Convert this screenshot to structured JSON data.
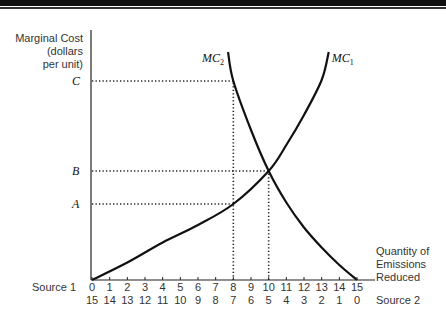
{
  "chart_data": {
    "type": "line",
    "title": "",
    "ylabel_lines": [
      "Marginal Cost",
      "(dollars",
      "per unit)"
    ],
    "xlabel_lines": [
      "Quantity of",
      "Emissions",
      "Reduced"
    ],
    "xlim": [
      0,
      15
    ],
    "ylim": [
      0,
      1
    ],
    "grid": false,
    "x_axis_rows": [
      {
        "label": "Source 1",
        "ticks": [
          "0",
          "1",
          "2",
          "3",
          "4",
          "5",
          "6",
          "7",
          "8",
          "9",
          "10",
          "11",
          "12",
          "13",
          "14",
          "15"
        ]
      },
      {
        "label": "Source 2",
        "ticks": [
          "15",
          "14",
          "13",
          "12",
          "11",
          "10",
          "9",
          "8",
          "7",
          "6",
          "5",
          "4",
          "3",
          "2",
          "1",
          "0"
        ]
      }
    ],
    "y_levels": [
      {
        "label": "C",
        "value": 0.796
      },
      {
        "label": "B",
        "value": 0.436
      },
      {
        "label": "A",
        "value": 0.304
      }
    ],
    "series": [
      {
        "name": "MC",
        "subscript": "1",
        "description": "Source 1 marginal cost, rising with Source 1 reduction",
        "points": [
          [
            0,
            0
          ],
          [
            2,
            0.07
          ],
          [
            4,
            0.15
          ],
          [
            6,
            0.22
          ],
          [
            8,
            0.304
          ],
          [
            10,
            0.436
          ],
          [
            11,
            0.54
          ],
          [
            12,
            0.66
          ],
          [
            13,
            0.8
          ],
          [
            13.4,
            0.912
          ]
        ]
      },
      {
        "name": "MC",
        "subscript": "2",
        "description": "Source 2 marginal cost, rising as Source 1 quantity falls",
        "points": [
          [
            7.7,
            0.912
          ],
          [
            8,
            0.796
          ],
          [
            9,
            0.6
          ],
          [
            10,
            0.436
          ],
          [
            11,
            0.31
          ],
          [
            12,
            0.21
          ],
          [
            13,
            0.13
          ],
          [
            14,
            0.06
          ],
          [
            15,
            0
          ]
        ]
      }
    ],
    "guides": [
      {
        "from": [
          0,
          0.796
        ],
        "to": [
          8,
          0.796
        ]
      },
      {
        "from": [
          0,
          0.436
        ],
        "to": [
          10,
          0.436
        ]
      },
      {
        "from": [
          0,
          0.304
        ],
        "to": [
          8,
          0.304
        ]
      },
      {
        "from": [
          8,
          0
        ],
        "to": [
          8,
          0.796
        ]
      },
      {
        "from": [
          10,
          0
        ],
        "to": [
          10,
          0.436
        ]
      }
    ]
  }
}
